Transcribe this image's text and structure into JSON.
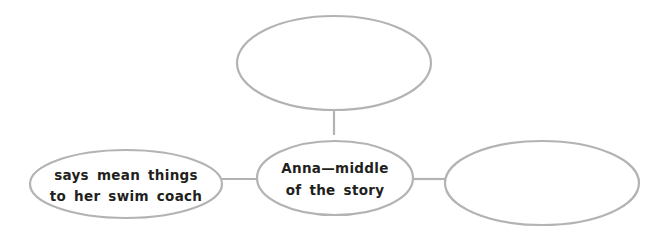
{
  "diagram": {
    "type": "web-organizer",
    "colors": {
      "outline": "#b3b3b3",
      "text": "#231f20",
      "background": "#ffffff"
    },
    "nodes": {
      "top": {
        "lines": []
      },
      "center": {
        "lines": [
          "Anna—middle",
          "of the story"
        ]
      },
      "left": {
        "lines": [
          "says mean things",
          "to her swim coach"
        ]
      },
      "right": {
        "lines": []
      }
    },
    "edges": [
      {
        "from": "center",
        "to": "top"
      },
      {
        "from": "center",
        "to": "left"
      },
      {
        "from": "center",
        "to": "right"
      }
    ]
  }
}
